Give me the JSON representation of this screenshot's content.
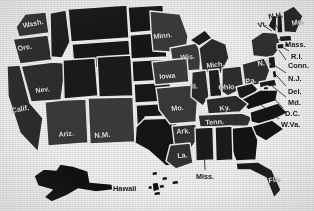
{
  "map": {
    "title": "United States map with state abbreviations",
    "colors": {
      "paper": "#f2f0ee",
      "state_fill_dark": "#1b1b1b",
      "state_fill_mid": "#3a3a3a",
      "state_border": "#f4f2f0",
      "label_on_dark": "#efeceb",
      "label_on_light": "#171717"
    },
    "inset_labels": [
      "Alaska",
      "Hawaii"
    ],
    "labels": [
      {
        "id": "wash",
        "text": "Wash.",
        "x": 22,
        "y": 22,
        "size": 7.2,
        "rot": -11,
        "tone": "on-dark"
      },
      {
        "id": "ore",
        "text": "Ore.",
        "x": 17,
        "y": 45,
        "size": 7.2,
        "rot": -9,
        "tone": "on-dark"
      },
      {
        "id": "nev",
        "text": "Nev.",
        "x": 35,
        "y": 87,
        "size": 7.0,
        "rot": -7,
        "tone": "on-dark"
      },
      {
        "id": "calif",
        "text": "Calif.",
        "x": 11,
        "y": 107,
        "size": 7.2,
        "rot": -10,
        "tone": "on-dark"
      },
      {
        "id": "ariz",
        "text": "Ariz.",
        "x": 58,
        "y": 131,
        "size": 7.2,
        "rot": -6,
        "tone": "on-dark"
      },
      {
        "id": "nm",
        "text": "N.M.",
        "x": 94,
        "y": 132,
        "size": 7.6,
        "rot": -4,
        "tone": "on-dark"
      },
      {
        "id": "minn",
        "text": "Minn.",
        "x": 153,
        "y": 33,
        "size": 7.2,
        "rot": -6,
        "tone": "on-dark"
      },
      {
        "id": "wis",
        "text": "Wis.",
        "x": 180,
        "y": 54,
        "size": 7.2,
        "rot": -5,
        "tone": "on-dark"
      },
      {
        "id": "iowa",
        "text": "Iowa",
        "x": 159,
        "y": 73,
        "size": 7.2,
        "rot": -5,
        "tone": "on-dark"
      },
      {
        "id": "mich",
        "text": "Mich.",
        "x": 206,
        "y": 62,
        "size": 7.0,
        "rot": -6,
        "tone": "on-dark"
      },
      {
        "id": "ill",
        "text": "Ill.",
        "x": 190,
        "y": 84,
        "size": 6.8,
        "rot": -5,
        "tone": "on-dark"
      },
      {
        "id": "ohio",
        "text": "Ohio",
        "x": 218,
        "y": 84,
        "size": 7.2,
        "rot": -4,
        "tone": "on-dark"
      },
      {
        "id": "pa",
        "text": "Pa.",
        "x": 245,
        "y": 78,
        "size": 7.4,
        "rot": -8,
        "tone": "on-dark"
      },
      {
        "id": "ny",
        "text": "N.Y.",
        "x": 257,
        "y": 60,
        "size": 7.4,
        "rot": -6,
        "tone": "on-dark"
      },
      {
        "id": "mo",
        "text": "Mo.",
        "x": 171,
        "y": 105,
        "size": 7.2,
        "rot": -5,
        "tone": "on-dark"
      },
      {
        "id": "ky",
        "text": "Ky.",
        "x": 219,
        "y": 105,
        "size": 7.2,
        "rot": -7,
        "tone": "on-dark"
      },
      {
        "id": "tenn",
        "text": "Tenn.",
        "x": 205,
        "y": 119,
        "size": 7.2,
        "rot": -4,
        "tone": "on-dark"
      },
      {
        "id": "ark",
        "text": "Ark.",
        "x": 176,
        "y": 128,
        "size": 7.2,
        "rot": -4,
        "tone": "on-dark"
      },
      {
        "id": "la",
        "text": "La.",
        "x": 177,
        "y": 152,
        "size": 7.2,
        "rot": -4,
        "tone": "on-dark"
      },
      {
        "id": "fla",
        "text": "Fla.",
        "x": 268,
        "y": 177,
        "size": 7.2,
        "rot": -8,
        "tone": "on-dark"
      },
      {
        "id": "miss",
        "text": "Miss.",
        "x": 196,
        "y": 173,
        "size": 7.2,
        "rot": 0,
        "tone": "on-light"
      },
      {
        "id": "hawaii",
        "text": "Hawaii",
        "x": 113,
        "y": 185,
        "size": 7.4,
        "rot": 0,
        "tone": "on-light"
      },
      {
        "id": "vt",
        "text": "Vt.",
        "x": 257,
        "y": 22,
        "size": 7.0,
        "rot": -14,
        "tone": "on-light"
      },
      {
        "id": "nh",
        "text": "N.H.",
        "x": 268,
        "y": 13,
        "size": 7.4,
        "rot": -7,
        "tone": "on-light"
      },
      {
        "id": "me",
        "text": "Me.",
        "x": 291,
        "y": 20,
        "size": 7.4,
        "rot": -12,
        "tone": "on-dark"
      },
      {
        "id": "mass",
        "text": "Mass.",
        "x": 285,
        "y": 41,
        "size": 7.4,
        "rot": 0,
        "tone": "on-light"
      },
      {
        "id": "ri",
        "text": "R.I.",
        "x": 291,
        "y": 53,
        "size": 7.4,
        "rot": 0,
        "tone": "on-light"
      },
      {
        "id": "conn",
        "text": "Conn.",
        "x": 288,
        "y": 62,
        "size": 7.4,
        "rot": 0,
        "tone": "on-light"
      },
      {
        "id": "nj",
        "text": "N.J.",
        "x": 288,
        "y": 75,
        "size": 7.4,
        "rot": 0,
        "tone": "on-light"
      },
      {
        "id": "del",
        "text": "Del.",
        "x": 288,
        "y": 88,
        "size": 7.4,
        "rot": 0,
        "tone": "on-light"
      },
      {
        "id": "md",
        "text": "Md.",
        "x": 288,
        "y": 99,
        "size": 7.4,
        "rot": 0,
        "tone": "on-light"
      },
      {
        "id": "dc",
        "text": "D.C.",
        "x": 285,
        "y": 110,
        "size": 7.4,
        "rot": 0,
        "tone": "on-light"
      },
      {
        "id": "wva",
        "text": "W.Va.",
        "x": 281,
        "y": 121,
        "size": 7.4,
        "rot": 0,
        "tone": "on-light"
      }
    ]
  }
}
